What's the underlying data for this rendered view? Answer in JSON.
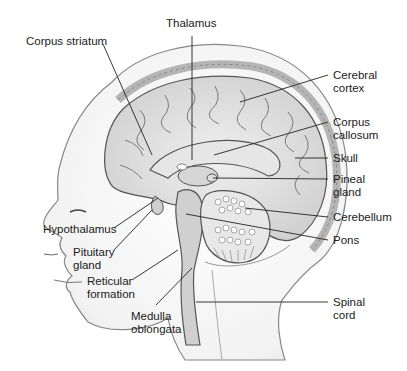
{
  "diagram": {
    "labels": {
      "thalamus": "Thalamus",
      "corpus_striatum": "Corpus striatum",
      "cerebral_cortex_1": "Cerebral",
      "cerebral_cortex_2": "cortex",
      "corpus_callosum_1": "Corpus",
      "corpus_callosum_2": "callosum",
      "skull": "Skull",
      "pineal_gland_1": "Pineal",
      "pineal_gland_2": "gland",
      "cerebellum": "Cerebellum",
      "pons": "Pons",
      "spinal_cord_1": "Spinal",
      "spinal_cord_2": "cord",
      "hypothalamus": "Hypothalamus",
      "pituitary_gland_1": "Pituitary",
      "pituitary_gland_2": "gland",
      "reticular_formation_1": "Reticular",
      "reticular_formation_2": "formation",
      "medulla_oblongata_1": "Medulla",
      "medulla_oblongata_2": "oblongata"
    }
  }
}
